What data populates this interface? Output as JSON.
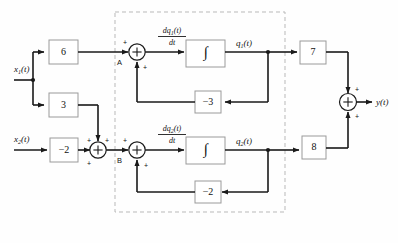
{
  "diagram": {
    "colors": {
      "line": "#1a1a1a",
      "box_stroke": "#9a9a9a",
      "dashed_stroke": "#b9b9b9",
      "background": "#fefefe",
      "text": "#111111"
    },
    "inputs": [
      {
        "id": "x1",
        "label": "x",
        "sub": "1",
        "suffix": "(t)"
      },
      {
        "id": "x2",
        "label": "x",
        "sub": "2",
        "suffix": "(t)"
      }
    ],
    "output": {
      "id": "y",
      "label": "y(t)"
    },
    "gain_blocks": [
      {
        "id": "g6",
        "value": "6"
      },
      {
        "id": "g3",
        "value": "3"
      },
      {
        "id": "gm2",
        "value": "−2"
      },
      {
        "id": "fbm3",
        "value": "−3"
      },
      {
        "id": "fbm2",
        "value": "−2"
      },
      {
        "id": "g7",
        "value": "7"
      },
      {
        "id": "g8",
        "value": "8"
      }
    ],
    "integrators": [
      {
        "id": "int1",
        "symbol": "∫"
      },
      {
        "id": "int2",
        "symbol": "∫"
      }
    ],
    "derivative_labels": [
      {
        "id": "dq1",
        "numerator": "dq",
        "num_sub": "1",
        "num_suffix": "(t)",
        "denominator": "dt"
      },
      {
        "id": "dq2",
        "numerator": "dq",
        "num_sub": "2",
        "num_suffix": "(t)",
        "denominator": "dt"
      }
    ],
    "state_labels": [
      {
        "id": "q1",
        "label": "q",
        "sub": "1",
        "suffix": "(t)"
      },
      {
        "id": "q2",
        "label": "q",
        "sub": "2",
        "suffix": "(t)"
      }
    ],
    "node_labels": [
      {
        "id": "nodeA",
        "label": "A"
      },
      {
        "id": "nodeB",
        "label": "B"
      }
    ],
    "signs": {
      "plus": "+"
    },
    "summing_junctions": [
      {
        "id": "sum-x2",
        "symbol": "+"
      },
      {
        "id": "sum-q1",
        "symbol": "+"
      },
      {
        "id": "sum-q2",
        "symbol": "+"
      },
      {
        "id": "sum-out",
        "symbol": "+"
      }
    ],
    "dashed_region": {
      "id": "state-block",
      "label": ""
    }
  }
}
